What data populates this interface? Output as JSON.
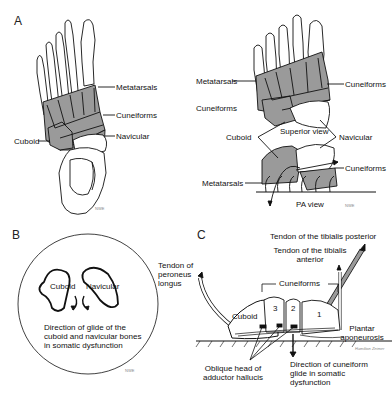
{
  "panels": {
    "A": {
      "letter": "A",
      "left_view": {
        "labels": {
          "metatarsals": "Metatarsals",
          "cuneiforms": "Cuneiforms",
          "navicular": "Navicular",
          "cuboid": "Cuboid"
        },
        "numbers": [
          "1",
          "2",
          "3",
          "4",
          "5",
          "1",
          "2",
          "3"
        ],
        "signature": "NWE"
      },
      "right_view": {
        "labels": {
          "metatarsals_top": "Metatarsals",
          "cuneiforms_left": "Cuneiforms",
          "cuneiforms_right": "Cuneiforms",
          "cuboid": "Cuboid",
          "superior_view": "Superior view",
          "navicular": "Navicular",
          "cuneiforms_bottom": "Cuneiforms",
          "metatarsals_bottom": "Metatarsals",
          "pa_view": "PA view"
        },
        "numbers": [
          "1",
          "2",
          "3",
          "4",
          "5",
          "1",
          "2",
          "3"
        ],
        "signature": "NWE"
      }
    },
    "B": {
      "letter": "B",
      "labels": {
        "cuboid": "Cuboid",
        "navicular": "Navicular"
      },
      "caption": "Direction of glide of the cuboid and navicular bones in somatic dysfunction",
      "signature": "NWE"
    },
    "C": {
      "letter": "C",
      "labels": {
        "tendon_tibialis_posterior": "Tendon of the tibialis posterior",
        "tendon_tibialis_anterior": "Tendon of the tibialis anterior",
        "tendon_peroneus_longus": "Tendon of peroneus longus",
        "cuneiforms": "Cuneiforms",
        "cuboid": "Cuboid",
        "num_3": "3",
        "num_2": "2",
        "num_1": "1",
        "plantar_aponeurosis": "Plantar aponeurosis",
        "oblique_head": "Oblique head of adductor hallucis",
        "direction": "Direction of cuneiform glide in somatic dysfunction"
      },
      "signature": "Hamilton Zeimer"
    }
  },
  "colors": {
    "bone_shade": "#9a9a9a",
    "line": "#111111",
    "background": "#ffffff"
  }
}
